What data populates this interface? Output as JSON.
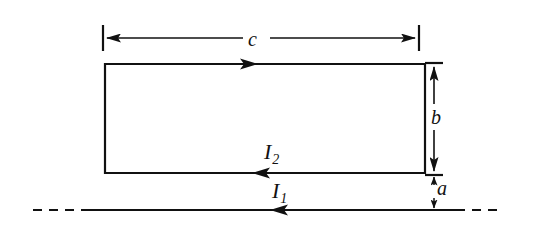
{
  "figure": {
    "background_color": "#ffffff",
    "stroke_color": "#111111",
    "width": 534,
    "height": 234
  },
  "labels": {
    "width_dimension": "c",
    "height_dimension": "b",
    "separation_dimension": "a",
    "loop_current": "I",
    "loop_current_subscript": "2",
    "wire_current": "I",
    "wire_current_subscript": "1"
  },
  "geometry": {
    "loop": {
      "left": 104,
      "right": 426,
      "top": 64,
      "bottom": 173,
      "stroke_width": 2.2,
      "current_direction_top": "right",
      "current_direction_bottom": "left"
    },
    "wire": {
      "y": 210,
      "solid_start": 85,
      "solid_end": 456,
      "dash_left_start": 33,
      "dash_right_end": 502,
      "stroke_width": 2.2,
      "current_direction": "left"
    },
    "dimension_c": {
      "y": 38,
      "x_start": 103,
      "x_end": 419,
      "tick_top": 25,
      "tick_bottom": 51
    },
    "dimension_b": {
      "x": 434,
      "y_top": 63,
      "y_bottom": 174,
      "tick_half_width": 9
    },
    "dimension_a": {
      "x": 434,
      "y_top": 175,
      "y_bottom": 210,
      "tick_half_width": 9
    }
  }
}
